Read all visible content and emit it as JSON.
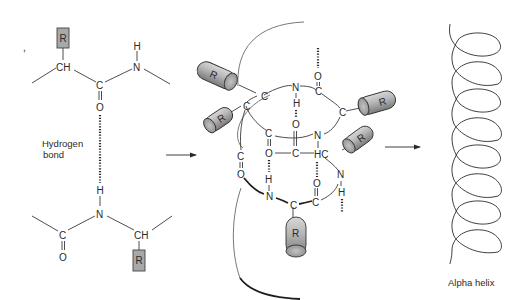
{
  "figure": {
    "colors": {
      "background": "#ffffff",
      "line": "#3a3a3a",
      "side_chain_fill": "#a8a8a8",
      "text": "#2a2a2a"
    }
  },
  "panel_left": {
    "mark": ",",
    "upper_residue": {
      "side_chain": "R",
      "alpha_carbon": "CH",
      "carbonyl_carbon": "C",
      "carbonyl_oxygen": "O",
      "amide_nitrogen": "N",
      "amide_hydrogen": "H"
    },
    "lower_residue": {
      "amide_hydrogen": "H",
      "amide_nitrogen": "N",
      "carbonyl_carbon": "C",
      "carbonyl_oxygen": "O",
      "alpha_carbon": "CH",
      "side_chain": "R"
    },
    "hbond_label_line1": "Hydrogen",
    "hbond_label_line2": "bond"
  },
  "panel_middle": {
    "side_chains": [
      "R",
      "R",
      "R",
      "R",
      "R"
    ],
    "atoms": {
      "n_top": "N",
      "h_top": "H",
      "o_top": "O",
      "c_top_right": "C",
      "o_top_far": "O",
      "c_right": "C",
      "c_left1": "C",
      "c_left2": "C",
      "c_mid1": "C",
      "o_mid1": "O",
      "n_mid": "N",
      "o_mid2": "O",
      "c_mid2": "C",
      "hc_mid": "HC",
      "c_far_left": "C",
      "o_far_left": "O",
      "o_lower1": "O",
      "h_lower1": "H",
      "n_lower1": "N",
      "c_lower1": "C",
      "c_lower2": "C",
      "o_lower2": "O",
      "n_right_lower": "N",
      "h_right_lower": "H"
    }
  },
  "panel_right": {
    "caption": "Alpha helix",
    "turns": 7
  },
  "arrows": [
    {
      "name": "left-to-middle"
    },
    {
      "name": "middle-to-right"
    }
  ]
}
